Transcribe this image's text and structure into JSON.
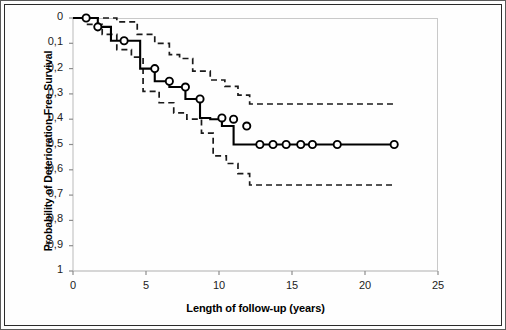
{
  "figure": {
    "y_axis_title": "Probability of Deterioration-Free Survival",
    "x_axis_title": "Length of follow-up (years)"
  },
  "axes": {
    "y_ticks": [
      "1",
      "0,9",
      "0,8",
      "0,7",
      "0,6",
      "0,5",
      "0,4",
      "0,3",
      "0,2",
      "0,1",
      "0"
    ],
    "x_ticks": [
      "0",
      "5",
      "10",
      "15",
      "20",
      "25"
    ]
  },
  "colors": {
    "curve": "#000000",
    "confidence": "#1a1a1a",
    "frame": "#2a2a2a",
    "axis": "#c9c9c9",
    "background": "#fefefe"
  },
  "chart_data": {
    "type": "line",
    "title": "",
    "xlabel": "Length of follow-up (years)",
    "ylabel": "Probability of Deterioration-Free Survival",
    "xlim": [
      0,
      25
    ],
    "ylim": [
      0,
      1
    ],
    "xticks": [
      0,
      5,
      10,
      15,
      20,
      25
    ],
    "yticks": [
      0,
      0.1,
      0.2,
      0.3,
      0.4,
      0.5,
      0.6,
      0.7,
      0.8,
      0.9,
      1
    ],
    "grid": false,
    "legend": "none",
    "series": [
      {
        "name": "Kaplan-Meier estimate",
        "style": "solid-step",
        "x": [
          0,
          0.9,
          1.7,
          2.6,
          3.5,
          4.6,
          5.6,
          6.6,
          7.7,
          8.7,
          9.4,
          10.2,
          11.0,
          11.9,
          12.8,
          13.7,
          14.6,
          15.6,
          16.4,
          18.1,
          22.0
        ],
        "y": [
          1.0,
          1.0,
          0.965,
          0.91,
          0.91,
          0.8,
          0.75,
          0.727,
          0.68,
          0.605,
          0.6,
          0.573,
          0.5,
          0.5,
          0.5,
          0.5,
          0.5,
          0.5,
          0.5,
          0.5,
          0.5
        ]
      },
      {
        "name": "Upper 95% confidence limit",
        "style": "dashed-step",
        "x": [
          0,
          1.1,
          2.0,
          3.0,
          3.9,
          4.4,
          5.6,
          6.6,
          7.3,
          8.2,
          9.4,
          10.4,
          11.3,
          12.1,
          22.0
        ],
        "y": [
          1.0,
          1.0,
          1.0,
          0.985,
          0.985,
          0.935,
          0.9,
          0.855,
          0.84,
          0.79,
          0.755,
          0.73,
          0.695,
          0.66,
          0.66
        ]
      },
      {
        "name": "Lower 95% confidence limit",
        "style": "dashed-step",
        "x": [
          0,
          1.0,
          2.0,
          3.0,
          4.0,
          4.8,
          5.9,
          6.9,
          7.8,
          8.8,
          9.6,
          10.5,
          11.3,
          12.1,
          22.0
        ],
        "y": [
          1.0,
          0.975,
          0.935,
          0.875,
          0.845,
          0.71,
          0.665,
          0.625,
          0.6,
          0.545,
          0.455,
          0.425,
          0.385,
          0.34,
          0.34
        ]
      }
    ],
    "censored_markers": {
      "note": "open circles on the Kaplan-Meier curve",
      "points": [
        {
          "x": 0.9,
          "y": 1.0
        },
        {
          "x": 1.7,
          "y": 0.965
        },
        {
          "x": 3.5,
          "y": 0.91
        },
        {
          "x": 5.6,
          "y": 0.8
        },
        {
          "x": 6.6,
          "y": 0.75
        },
        {
          "x": 7.7,
          "y": 0.727
        },
        {
          "x": 8.7,
          "y": 0.68
        },
        {
          "x": 10.2,
          "y": 0.605
        },
        {
          "x": 11.0,
          "y": 0.6
        },
        {
          "x": 11.9,
          "y": 0.573
        },
        {
          "x": 12.8,
          "y": 0.5
        },
        {
          "x": 13.7,
          "y": 0.5
        },
        {
          "x": 14.6,
          "y": 0.5
        },
        {
          "x": 15.6,
          "y": 0.5
        },
        {
          "x": 16.4,
          "y": 0.5
        },
        {
          "x": 18.1,
          "y": 0.5
        },
        {
          "x": 22.0,
          "y": 0.5
        }
      ]
    }
  }
}
